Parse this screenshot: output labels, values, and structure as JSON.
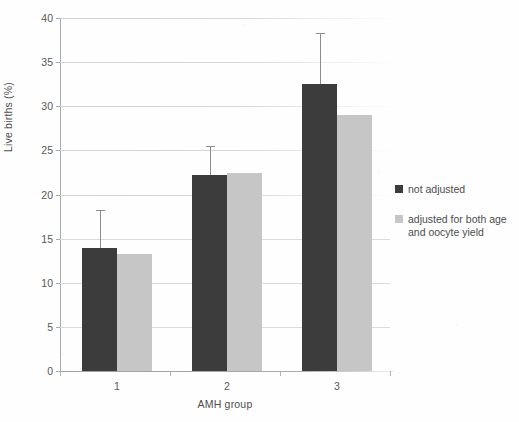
{
  "chart_data": {
    "type": "bar",
    "title": "",
    "xlabel": "AMH group",
    "ylabel": "Live births (%)",
    "categories": [
      "1",
      "2",
      "3"
    ],
    "ylim": [
      0,
      40
    ],
    "yticks": [
      0,
      5,
      10,
      15,
      20,
      25,
      30,
      35,
      40
    ],
    "ytick_labels": [
      "0",
      "5",
      "10",
      "15",
      "20",
      "25",
      "30",
      "35",
      "40"
    ],
    "grid": true,
    "legend_position": "right",
    "series": [
      {
        "name": "not adjusted",
        "color": "#3c3c3c",
        "values": [
          13.9,
          22.2,
          32.5
        ],
        "error_upper": [
          18.3,
          25.5,
          38.3
        ]
      },
      {
        "name": "adjusted for both age and oocyte yield",
        "color": "#c6c6c6",
        "values": [
          13.3,
          22.4,
          29.0
        ],
        "error_upper": [
          null,
          null,
          null
        ]
      }
    ]
  },
  "legend": {
    "entries": [
      {
        "label": "not adjusted",
        "swatch": "dark"
      },
      {
        "label": "adjusted for both age and oocyte yield",
        "swatch": "light"
      }
    ]
  },
  "axes": {
    "y_title": "Live births (%)",
    "x_title": "AMH group"
  }
}
